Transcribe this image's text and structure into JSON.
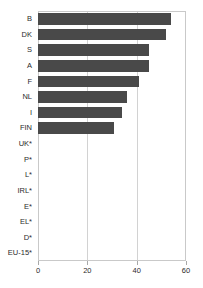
{
  "chart_data": {
    "type": "bar",
    "orientation": "horizontal",
    "title": "",
    "subtitle": "",
    "xlabel": "",
    "ylabel": "",
    "xlim": [
      0,
      60
    ],
    "xticks": [
      0,
      20,
      40,
      60
    ],
    "xtick_labels": [
      "0",
      "20",
      "40",
      "60"
    ],
    "grid": true,
    "grid_axis": "x",
    "legend": false,
    "legend_position": "none",
    "bar_color": "#494949",
    "categories": [
      "B",
      "DK",
      "S",
      "A",
      "F",
      "NL",
      "I",
      "FIN",
      "UK*",
      "P*",
      "L*",
      "IRL*",
      "E*",
      "EL*",
      "D*",
      "EU-15*"
    ],
    "values": [
      54,
      52,
      45,
      45,
      41,
      36,
      34,
      31,
      0,
      0,
      0,
      0,
      0,
      0,
      0,
      0
    ]
  },
  "axis": {
    "x_ticks": [
      {
        "label": "0",
        "value": 0
      },
      {
        "label": "20",
        "value": 20
      },
      {
        "label": "40",
        "value": 40
      },
      {
        "label": "60",
        "value": 60
      }
    ]
  }
}
